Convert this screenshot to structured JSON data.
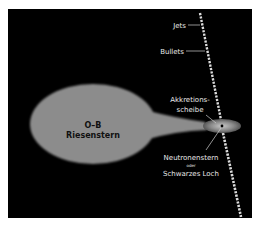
{
  "diagram": {
    "type": "astronomy-illustration",
    "background_color": "#000000",
    "star": {
      "label_line1": "O–B",
      "label_line2": "Riesenstern",
      "color": "#8c8c8c"
    },
    "labels": {
      "jets": "Jets",
      "bullets": "Bullets",
      "disk_line1": "Akkretions-",
      "disk_line2": "scheibe",
      "compact_line1": "Neutronenstern",
      "compact_or": "oder",
      "compact_line2": "Schwarzes Loch"
    }
  }
}
